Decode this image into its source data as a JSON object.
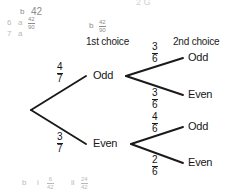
{
  "diagram": {
    "type": "probability-tree",
    "headers": {
      "first": "1st choice",
      "second": "2nd choice"
    },
    "nodes": {
      "root": "",
      "first_odd": "Odd",
      "first_even": "Even",
      "leaf_odd_odd": "Odd",
      "leaf_odd_even": "Even",
      "leaf_even_odd": "Odd",
      "leaf_even_even": "Even"
    },
    "branches": [
      {
        "id": "root-odd",
        "from": "root",
        "to": "Odd",
        "numerator": "4",
        "denominator": "7"
      },
      {
        "id": "root-even",
        "from": "root",
        "to": "Even",
        "numerator": "3",
        "denominator": "7"
      },
      {
        "id": "odd-odd",
        "from": "Odd",
        "to": "Odd",
        "numerator": "3",
        "denominator": "6"
      },
      {
        "id": "odd-even",
        "from": "Odd",
        "to": "Even",
        "numerator": "3",
        "denominator": "6"
      },
      {
        "id": "even-odd",
        "from": "Even",
        "to": "Odd",
        "numerator": "4",
        "denominator": "6"
      },
      {
        "id": "even-even",
        "from": "Even",
        "to": "Even",
        "numerator": "2",
        "denominator": "6"
      }
    ]
  },
  "margin_notes": {
    "clipped_top": "2        G",
    "note_b_42_label": "b",
    "note_b_42_value": "42",
    "note_6_number": "6",
    "note_6_part": "a",
    "note_6_num": "42",
    "note_6_den": "90",
    "note_7_number": "7",
    "note_7_part": "a",
    "note_mid_label": "b",
    "note_mid_num": "42",
    "note_mid_den": "90",
    "bottom_label": "b",
    "bottom_i_label": "i",
    "bottom_i_num": "6",
    "bottom_i_den": "42",
    "bottom_ii_label": "ii",
    "bottom_ii_num": "24",
    "bottom_ii_den": "42"
  },
  "colors": {
    "ink": "#1a1a1a",
    "faint": "#b9b9b9",
    "faint_dark": "#8d8d8d",
    "background": "#ffffff"
  }
}
